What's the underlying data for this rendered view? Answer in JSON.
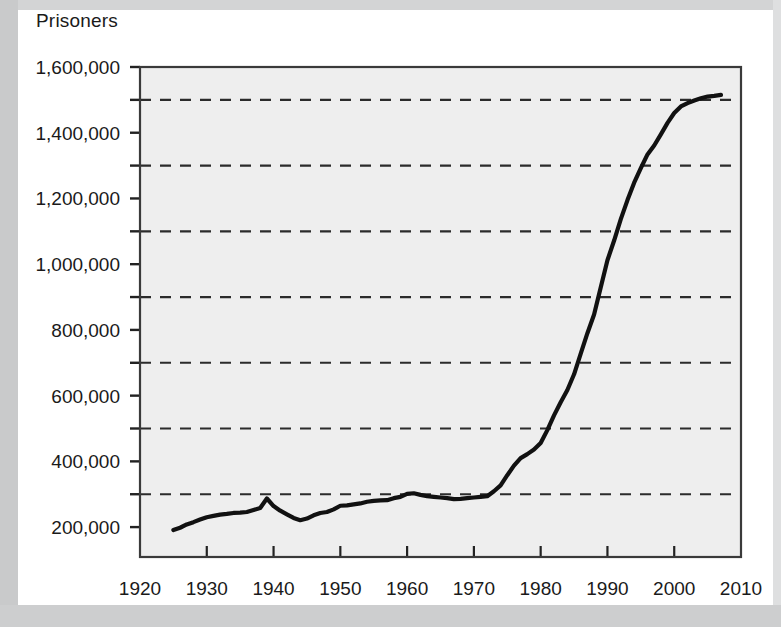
{
  "chart_data": {
    "type": "line",
    "title": "Prisoners",
    "xlabel": "",
    "ylabel": "Prisoners",
    "xlim": [
      1920,
      2010
    ],
    "ylim": [
      109000,
      1600000
    ],
    "grid": true,
    "grid_style": "dashed-horizontal",
    "legend": "none",
    "x_ticks": [
      1920,
      1930,
      1940,
      1950,
      1960,
      1970,
      1980,
      1990,
      2000,
      2010
    ],
    "x_tick_labels": [
      "1920",
      "1930",
      "1940",
      "1950",
      "1960",
      "1970",
      "1980",
      "1990",
      "2000",
      "2010"
    ],
    "y_ticks": [
      200000,
      400000,
      600000,
      800000,
      1000000,
      1200000,
      1400000,
      1600000
    ],
    "y_tick_labels": [
      "200,000",
      "400,000",
      "600,000",
      "800,000",
      "1,000,000",
      "1,200,000",
      "1,400,000",
      "1,600,000"
    ],
    "y_gridlines": [
      300000,
      500000,
      700000,
      900000,
      1100000,
      1300000,
      1500000
    ],
    "series": [
      {
        "name": "Prisoners",
        "color": "#111111",
        "x": [
          1925,
          1926,
          1927,
          1928,
          1929,
          1930,
          1931,
          1932,
          1933,
          1934,
          1935,
          1936,
          1937,
          1938,
          1939,
          1940,
          1941,
          1942,
          1943,
          1944,
          1945,
          1946,
          1947,
          1948,
          1949,
          1950,
          1951,
          1952,
          1953,
          1954,
          1955,
          1956,
          1957,
          1958,
          1959,
          1960,
          1961,
          1962,
          1963,
          1964,
          1965,
          1966,
          1967,
          1968,
          1969,
          1970,
          1971,
          1972,
          1973,
          1974,
          1975,
          1976,
          1977,
          1978,
          1979,
          1980,
          1981,
          1982,
          1983,
          1984,
          1985,
          1986,
          1987,
          1988,
          1989,
          1990,
          1991,
          1992,
          1993,
          1994,
          1995,
          1996,
          1997,
          1998,
          1999,
          2000,
          2001,
          2002,
          2003,
          2004,
          2005,
          2006,
          2007
        ],
        "y": [
          191000,
          198000,
          208000,
          215000,
          223000,
          230000,
          234000,
          238000,
          240000,
          243000,
          244000,
          246000,
          252000,
          258000,
          287000,
          264000,
          250000,
          239000,
          228000,
          221000,
          226000,
          236000,
          243000,
          246000,
          254000,
          265000,
          266000,
          269000,
          272000,
          277000,
          280000,
          281000,
          282000,
          288000,
          292000,
          301000,
          303000,
          298000,
          294000,
          292000,
          290000,
          288000,
          285000,
          286000,
          288000,
          290000,
          292000,
          294000,
          309000,
          327000,
          358000,
          387000,
          410000,
          422000,
          436000,
          456000,
          495000,
          540000,
          580000,
          617000,
          665000,
          728000,
          790000,
          847000,
          930000,
          1012000,
          1072000,
          1137000,
          1195000,
          1248000,
          1292000,
          1334000,
          1361000,
          1395000,
          1430000,
          1460000,
          1480000,
          1490000,
          1498000,
          1505000,
          1510000,
          1512000,
          1515000
        ]
      }
    ]
  },
  "axis": {
    "y_label_top": "1,600,000"
  }
}
